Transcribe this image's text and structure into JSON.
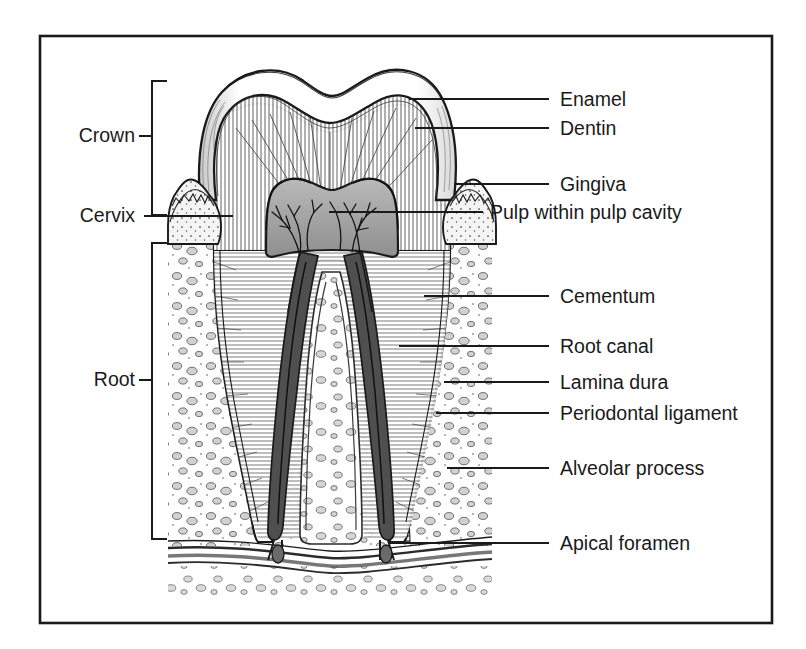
{
  "figure": {
    "kind": "anatomical-illustration",
    "frame_color": "#1a1a1a",
    "ink_color": "#1a1a1a",
    "paper_color": "#ffffff"
  },
  "left_labels": [
    {
      "id": "crown",
      "text": "Crown",
      "text_x": 135,
      "text_y": 142,
      "bracket": {
        "x": 152,
        "top": 81,
        "bottom": 215,
        "tick_y": 136,
        "tick_x": 140
      }
    },
    {
      "id": "cervix",
      "text": "Cervix",
      "text_x": 135,
      "text_y": 222,
      "leader": {
        "x1": 145,
        "x2": 232,
        "y": 216
      }
    },
    {
      "id": "root",
      "text": "Root",
      "text_x": 135,
      "text_y": 386,
      "bracket": {
        "x": 152,
        "top": 243,
        "bottom": 539,
        "tick_y": 380,
        "tick_x": 140
      }
    }
  ],
  "right_labels": [
    {
      "id": "enamel",
      "text": "Enamel",
      "text_x": 560,
      "text_y": 106,
      "leader": {
        "x1": 410,
        "x2": 548,
        "y": 99
      }
    },
    {
      "id": "dentin",
      "text": "Dentin",
      "text_x": 560,
      "text_y": 135,
      "leader": {
        "x1": 416,
        "x2": 548,
        "y": 128
      }
    },
    {
      "id": "gingiva",
      "text": "Gingiva",
      "text_x": 560,
      "text_y": 191,
      "leader": {
        "x1": 455,
        "x2": 548,
        "y": 184
      }
    },
    {
      "id": "pulp-within-pulp-cavity",
      "text": "Pulp within pulp cavity",
      "text_x": 490,
      "text_y": 219,
      "leader": {
        "x1": 330,
        "x2": 482,
        "y": 212
      }
    },
    {
      "id": "cementum",
      "text": "Cementum",
      "text_x": 560,
      "text_y": 303,
      "leader": {
        "x1": 425,
        "x2": 548,
        "y": 296
      }
    },
    {
      "id": "root-canal",
      "text": "Root canal",
      "text_x": 560,
      "text_y": 353,
      "leader": {
        "x1": 400,
        "x2": 548,
        "y": 346
      }
    },
    {
      "id": "lamina-dura",
      "text": "Lamina dura",
      "text_x": 560,
      "text_y": 389,
      "leader": {
        "x1": 445,
        "x2": 548,
        "y": 382
      }
    },
    {
      "id": "periodontal-ligament",
      "text": "Periodontal ligament",
      "text_x": 560,
      "text_y": 420,
      "leader": {
        "x1": 437,
        "x2": 548,
        "y": 413
      }
    },
    {
      "id": "alveolar-process",
      "text": "Alveolar process",
      "text_x": 560,
      "text_y": 475,
      "leader": {
        "x1": 448,
        "x2": 548,
        "y": 468
      }
    },
    {
      "id": "apical-foramen",
      "text": "Apical foramen",
      "text_x": 560,
      "text_y": 550,
      "leader": {
        "x1": 390,
        "x2": 548,
        "y": 543
      }
    }
  ],
  "structures": [
    {
      "id": "enamel",
      "name": "Enamel"
    },
    {
      "id": "dentin",
      "name": "Dentin"
    },
    {
      "id": "gingiva",
      "name": "Gingiva"
    },
    {
      "id": "pulp-chamber",
      "name": "Pulp within pulp cavity"
    },
    {
      "id": "cementum",
      "name": "Cementum"
    },
    {
      "id": "root-canal",
      "name": "Root canal"
    },
    {
      "id": "lamina-dura",
      "name": "Lamina dura"
    },
    {
      "id": "periodontal-ligament",
      "name": "Periodontal ligament"
    },
    {
      "id": "alveolar-process",
      "name": "Alveolar process"
    },
    {
      "id": "apical-foramen",
      "name": "Apical foramen"
    }
  ]
}
